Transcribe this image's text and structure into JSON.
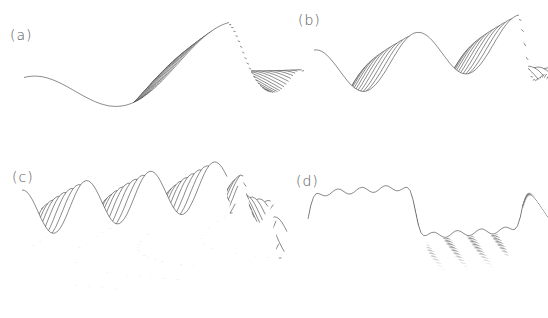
{
  "figure": {
    "background": "#ffffff",
    "line_color": "#2a2a2a",
    "label_color": "#555555"
  },
  "chart_data": [
    {
      "type": "surface-wireframe",
      "label": "(a)",
      "title": "",
      "xlabel": "",
      "ylabel": "",
      "zlabel": "",
      "grid": false,
      "description": "Smooth single-frequency wave surface with a swept fold near center",
      "pattern": "sine",
      "frequency": 1.0,
      "amplitude": 1.0,
      "lines": 34
    },
    {
      "type": "surface-wireframe",
      "label": "(b)",
      "title": "",
      "xlabel": "",
      "ylabel": "",
      "zlabel": "",
      "grid": false,
      "description": "Higher-frequency wave surface with sharp crests and a central caustic",
      "pattern": "sine",
      "frequency": 2.0,
      "amplitude": 1.0,
      "lines": 26
    },
    {
      "type": "surface-wireframe",
      "label": "(c)",
      "title": "",
      "xlabel": "",
      "ylabel": "",
      "zlabel": "",
      "grid": false,
      "description": "Still higher-frequency wave surface with many crests",
      "pattern": "sine",
      "frequency": 3.2,
      "amplitude": 1.0,
      "lines": 22
    },
    {
      "type": "surface-wireframe",
      "label": "(d)",
      "title": "",
      "xlabel": "",
      "ylabel": "",
      "zlabel": "",
      "grid": false,
      "description": "Square-wave-like surface with steep cliffs and fine ripples",
      "pattern": "square",
      "frequency": 1.0,
      "amplitude": 1.0,
      "lines": 40
    }
  ],
  "panels": [
    {
      "label": "(a)",
      "x": 0,
      "y": 0,
      "w": 274,
      "h": 159,
      "label_x": 10,
      "label_y": 27,
      "origin": [
        24,
        105
      ],
      "ax": [
        205,
        -55
      ],
      "ay": [
        75,
        48
      ],
      "zscale": 55
    },
    {
      "label": "(b)",
      "x": 274,
      "y": 0,
      "w": 274,
      "h": 159,
      "label_x": 24,
      "label_y": 12,
      "origin": [
        40,
        75
      ],
      "ax": [
        205,
        -35
      ],
      "ay": [
        60,
        55
      ],
      "zscale": 50
    },
    {
      "label": "(c)",
      "x": 0,
      "y": 159,
      "w": 274,
      "h": 159,
      "label_x": 12,
      "label_y": 10,
      "origin": [
        22,
        55
      ],
      "ax": [
        205,
        -30
      ],
      "ay": [
        60,
        55
      ],
      "zscale": 48
    },
    {
      "label": "(d)",
      "x": 274,
      "y": 159,
      "w": 274,
      "h": 159,
      "label_x": 22,
      "label_y": 14,
      "origin": [
        34,
        60
      ],
      "ax": [
        215,
        -15
      ],
      "ay": [
        40,
        60
      ],
      "zscale": 50
    }
  ]
}
